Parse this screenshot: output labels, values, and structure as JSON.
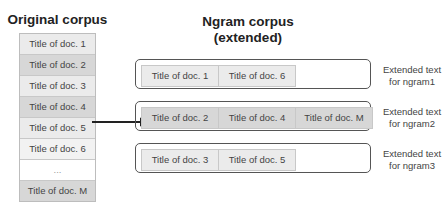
{
  "left": {
    "title": "Original corpus",
    "docs": [
      {
        "label": "Title of doc. 1",
        "shade": "light"
      },
      {
        "label": "Title of doc. 2",
        "shade": "dark"
      },
      {
        "label": "Title of doc. 3",
        "shade": "light"
      },
      {
        "label": "Title of doc. 4",
        "shade": "dark"
      },
      {
        "label": "Title of doc. 5",
        "shade": "light"
      },
      {
        "label": "Title of doc. 6",
        "shade": "lighter"
      },
      {
        "label": "...",
        "shade": "white"
      },
      {
        "label": "Title of doc. M",
        "shade": "dark"
      }
    ]
  },
  "right": {
    "title_line1": "Ngram corpus",
    "title_line2": "(extended)",
    "ngrams": [
      {
        "docs": [
          "Title of doc. 1",
          "Title of doc. 6"
        ],
        "shade": "light",
        "ext_line1": "Extended text",
        "ext_line2": "for ngram1"
      },
      {
        "docs": [
          "Title of doc. 2",
          "Title of doc. 4",
          "Title of doc. M"
        ],
        "shade": "dark",
        "ext_line1": "Extended text",
        "ext_line2": "for ngram2"
      },
      {
        "docs": [
          "Title of doc. 3",
          "Title of doc. 5"
        ],
        "shade": "light",
        "ext_line1": "Extended text",
        "ext_line2": "for ngram3"
      }
    ]
  },
  "colors": {
    "light": "#ebebeb",
    "dark": "#d7d7d7",
    "lighter": "#f2f2f2",
    "white": "#ffffff",
    "border": "#555555"
  }
}
